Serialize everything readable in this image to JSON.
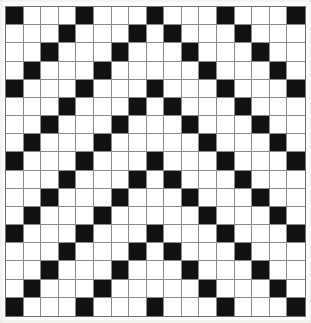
{
  "figure": {
    "type": "binary-grid-pattern"
  },
  "grid": {
    "rows": 17,
    "cols": 17,
    "cell_size_px": 17.6,
    "period": 4,
    "colors": {
      "on": "#111111",
      "off": "#ffffff",
      "gridline": "#8a8a8a",
      "border": "#6f6f6f",
      "background": "#fcfcfb"
    },
    "legend": {
      "on_label": "filled",
      "off_label": "empty"
    },
    "row_black_columns": [
      [
        1,
        5,
        9,
        13,
        17
      ],
      [
        4,
        8,
        10,
        14
      ],
      [
        3,
        7,
        11,
        15
      ],
      [
        2,
        6,
        12,
        16
      ],
      [
        1,
        5,
        9,
        13,
        17
      ],
      [
        4,
        8,
        10,
        14
      ],
      [
        3,
        7,
        11,
        15
      ],
      [
        2,
        6,
        12,
        16
      ],
      [
        1,
        5,
        9,
        13,
        17
      ],
      [
        4,
        8,
        10,
        14
      ],
      [
        3,
        7,
        11,
        15
      ],
      [
        2,
        6,
        12,
        16
      ],
      [
        1,
        5,
        9,
        13,
        17
      ],
      [
        4,
        8,
        10,
        14
      ],
      [
        3,
        7,
        11,
        15
      ],
      [
        2,
        6,
        12,
        16
      ],
      [
        1,
        5,
        9,
        13,
        17
      ]
    ],
    "matrix": [
      [
        1,
        0,
        0,
        0,
        1,
        0,
        0,
        0,
        1,
        0,
        0,
        0,
        1,
        0,
        0,
        0,
        1
      ],
      [
        0,
        0,
        0,
        1,
        0,
        0,
        0,
        1,
        0,
        1,
        0,
        0,
        0,
        1,
        0,
        0,
        0
      ],
      [
        0,
        0,
        1,
        0,
        0,
        0,
        1,
        0,
        0,
        0,
        1,
        0,
        0,
        0,
        1,
        0,
        0
      ],
      [
        0,
        1,
        0,
        0,
        0,
        1,
        0,
        0,
        0,
        0,
        0,
        1,
        0,
        0,
        0,
        1,
        0
      ],
      [
        1,
        0,
        0,
        0,
        1,
        0,
        0,
        0,
        1,
        0,
        0,
        0,
        1,
        0,
        0,
        0,
        1
      ],
      [
        0,
        0,
        0,
        1,
        0,
        0,
        0,
        1,
        0,
        1,
        0,
        0,
        0,
        1,
        0,
        0,
        0
      ],
      [
        0,
        0,
        1,
        0,
        0,
        0,
        1,
        0,
        0,
        0,
        1,
        0,
        0,
        0,
        1,
        0,
        0
      ],
      [
        0,
        1,
        0,
        0,
        0,
        1,
        0,
        0,
        0,
        0,
        0,
        1,
        0,
        0,
        0,
        1,
        0
      ],
      [
        1,
        0,
        0,
        0,
        1,
        0,
        0,
        0,
        1,
        0,
        0,
        0,
        1,
        0,
        0,
        0,
        1
      ],
      [
        0,
        0,
        0,
        1,
        0,
        0,
        0,
        1,
        0,
        1,
        0,
        0,
        0,
        1,
        0,
        0,
        0
      ],
      [
        0,
        0,
        1,
        0,
        0,
        0,
        1,
        0,
        0,
        0,
        1,
        0,
        0,
        0,
        1,
        0,
        0
      ],
      [
        0,
        1,
        0,
        0,
        0,
        1,
        0,
        0,
        0,
        0,
        0,
        1,
        0,
        0,
        0,
        1,
        0
      ],
      [
        1,
        0,
        0,
        0,
        1,
        0,
        0,
        0,
        1,
        0,
        0,
        0,
        1,
        0,
        0,
        0,
        1
      ],
      [
        0,
        0,
        0,
        1,
        0,
        0,
        0,
        1,
        0,
        1,
        0,
        0,
        0,
        1,
        0,
        0,
        0
      ],
      [
        0,
        0,
        1,
        0,
        0,
        0,
        1,
        0,
        0,
        0,
        1,
        0,
        0,
        0,
        1,
        0,
        0
      ],
      [
        0,
        1,
        0,
        0,
        0,
        1,
        0,
        0,
        0,
        0,
        0,
        1,
        0,
        0,
        0,
        1,
        0
      ],
      [
        1,
        0,
        0,
        0,
        1,
        0,
        0,
        0,
        1,
        0,
        0,
        0,
        1,
        0,
        0,
        0,
        1
      ]
    ]
  }
}
